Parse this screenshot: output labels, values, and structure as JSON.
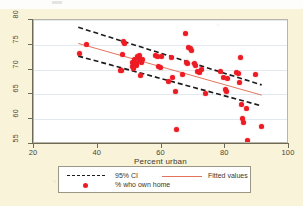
{
  "figure": {
    "background_color": "#f8f3d9",
    "panel_color": "#ffffff",
    "accent_color": "#ed1c24",
    "fit_line_color": "#e2725b",
    "ci_line_color": "#1c1c1c"
  },
  "chart_data": {
    "type": "scatter",
    "title": "",
    "xlabel": "Percent urban",
    "ylabel": "",
    "xlim": [
      20,
      100
    ],
    "ylim": [
      55,
      80
    ],
    "xticks": [
      20,
      40,
      60,
      80,
      100
    ],
    "yticks": [
      55,
      60,
      65,
      70,
      75,
      80
    ],
    "xtick_labels": [
      "20",
      "40",
      "60",
      "80",
      "100"
    ],
    "ytick_labels": [
      "55",
      "60",
      "65",
      "70",
      "75",
      "80"
    ],
    "grid": "horizontal",
    "legend_position": "below-axes",
    "series": [
      {
        "name": "% who own home",
        "type": "scatter",
        "marker": "circle",
        "color": "#ed1c24",
        "points": [
          [
            34.2,
            73.2
          ],
          [
            36.4,
            75.1
          ],
          [
            47.0,
            69.9
          ],
          [
            47.6,
            69.9
          ],
          [
            47.9,
            73.1
          ],
          [
            48.1,
            75.6
          ],
          [
            48.4,
            75.2
          ],
          [
            50.8,
            70.6
          ],
          [
            51.0,
            71.4
          ],
          [
            51.3,
            70.2
          ],
          [
            51.6,
            72.0
          ],
          [
            52.0,
            71.2
          ],
          [
            52.3,
            70.9
          ],
          [
            52.6,
            72.6
          ],
          [
            53.0,
            72.9
          ],
          [
            53.2,
            72.1
          ],
          [
            53.5,
            71.8
          ],
          [
            53.8,
            71.4
          ],
          [
            54.1,
            72.0
          ],
          [
            53.4,
            68.9
          ],
          [
            58.0,
            72.9
          ],
          [
            58.6,
            72.6
          ],
          [
            59.2,
            70.6
          ],
          [
            59.6,
            70.4
          ],
          [
            60.1,
            72.7
          ],
          [
            62.3,
            67.6
          ],
          [
            63.2,
            72.5
          ],
          [
            63.6,
            68.4
          ],
          [
            64.4,
            65.6
          ],
          [
            64.8,
            57.9
          ],
          [
            66.5,
            69.1
          ],
          [
            67.4,
            77.2
          ],
          [
            67.8,
            71.4
          ],
          [
            68.2,
            71.2
          ],
          [
            68.6,
            74.5
          ],
          [
            69.0,
            74.2
          ],
          [
            69.4,
            73.8
          ],
          [
            70.2,
            71.2
          ],
          [
            70.6,
            70.8
          ],
          [
            71.4,
            69.6
          ],
          [
            71.8,
            69.4
          ],
          [
            72.6,
            70.0
          ],
          [
            73.8,
            65.1
          ],
          [
            78.6,
            69.7
          ],
          [
            79.6,
            68.4
          ],
          [
            80.1,
            66.0
          ],
          [
            80.4,
            65.6
          ],
          [
            80.8,
            68.3
          ],
          [
            83.6,
            69.4
          ],
          [
            84.0,
            69.2
          ],
          [
            84.4,
            67.5
          ],
          [
            84.8,
            72.4
          ],
          [
            85.0,
            63.0
          ],
          [
            85.4,
            60.1
          ],
          [
            85.8,
            59.4
          ],
          [
            86.6,
            62.2
          ],
          [
            87.0,
            55.7
          ],
          [
            89.6,
            69.0
          ],
          [
            91.4,
            58.5
          ]
        ]
      },
      {
        "name": "Fitted values",
        "type": "line",
        "color": "#e2725b",
        "endpoints": [
          [
            34.0,
            75.2
          ],
          [
            92.0,
            64.6
          ]
        ]
      },
      {
        "name": "95% CI",
        "type": "band",
        "color": "#1c1c1c",
        "style": "dashed",
        "upper_endpoints": [
          [
            34.0,
            78.5
          ],
          [
            92.0,
            66.7
          ]
        ],
        "lower_endpoints": [
          [
            34.0,
            72.6
          ],
          [
            92.0,
            62.4
          ]
        ]
      }
    ]
  },
  "legend": {
    "items": [
      {
        "label": "95% CI",
        "marker": "dashed-line",
        "color": "#1c1c1c"
      },
      {
        "label": "Fitted values",
        "marker": "solid-line",
        "color": "#e2725b"
      },
      {
        "label": "% who own home",
        "marker": "dot",
        "color": "#ed1c24"
      }
    ]
  }
}
